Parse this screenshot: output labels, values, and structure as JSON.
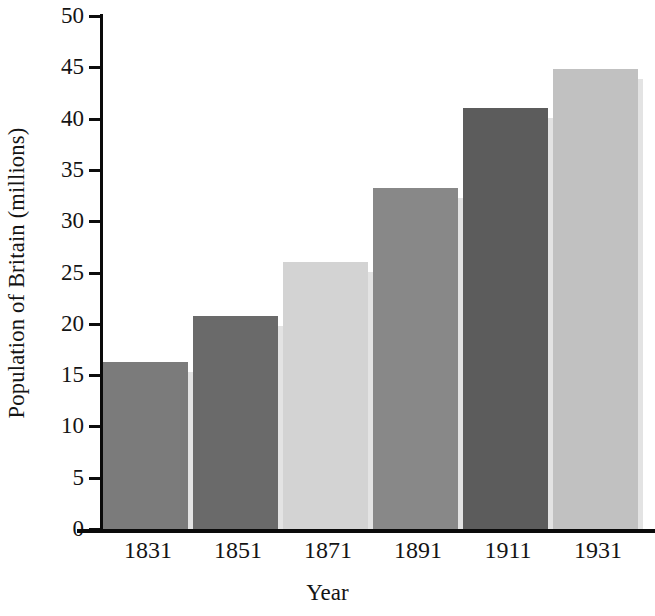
{
  "chart_data": {
    "type": "bar",
    "title": "",
    "subtitle": "",
    "xlabel": "Year",
    "ylabel": "Population of Britain (millions)",
    "categories": [
      "1831",
      "1851",
      "1871",
      "1891",
      "1911",
      "1931"
    ],
    "values": [
      16.3,
      20.8,
      26.0,
      33.2,
      41.0,
      44.8
    ],
    "series": [
      {
        "name": "Population of Britain",
        "values": [
          16.3,
          20.8,
          26.0,
          33.2,
          41.0,
          44.8
        ]
      }
    ],
    "ylim": [
      0,
      50
    ],
    "y_ticks": [
      0,
      5,
      10,
      15,
      20,
      25,
      30,
      35,
      40,
      45,
      50
    ],
    "y_tick_labels": [
      "0",
      "5",
      "10",
      "15",
      "20",
      "25",
      "30",
      "35",
      "40",
      "45",
      "50"
    ],
    "grid": false,
    "legend": "none",
    "bar_colors": [
      "#7b7b7b",
      "#6a6a6a",
      "#d3d3d3",
      "#888888",
      "#5c5c5c",
      "#c1c1c1"
    ],
    "bar_shadow_color": "#e3e3e3",
    "axis_color": "#0a0a0a",
    "background_color": "#ffffff",
    "text_color": "#141414"
  },
  "axes": {
    "y_title": "Population of Britain (millions)",
    "x_title": "Year"
  }
}
